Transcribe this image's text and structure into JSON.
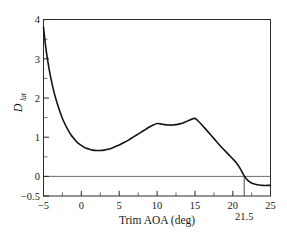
{
  "chart_data": {
    "type": "line",
    "title": "",
    "xlabel": "Trim AOA (deg)",
    "ylabel": "D_lat",
    "ylabel_main": "D",
    "ylabel_sub": "lat",
    "xlim": [
      -5,
      25
    ],
    "ylim": [
      -0.5,
      4
    ],
    "grid": false,
    "legend": null,
    "xticks": [
      -5,
      0,
      5,
      10,
      15,
      20,
      25
    ],
    "xtick_labels": [
      "−5",
      "0",
      "5",
      "10",
      "15",
      "20",
      "25"
    ],
    "xticks_minor": [
      -2.5,
      2.5,
      7.5,
      12.5,
      17.5,
      22.5
    ],
    "yticks": [
      -0.5,
      0,
      1,
      2,
      3,
      4
    ],
    "ytick_labels": [
      "−0.5",
      "0",
      "1",
      "2",
      "3",
      "4"
    ],
    "yticks_minor": [
      0.5,
      1.5,
      2.5,
      3.5
    ],
    "series": [
      {
        "name": "D_lat",
        "color": "#141414",
        "x": [
          -5.0,
          -4.8,
          -4.6,
          -4.4,
          -4.2,
          -4.0,
          -3.7,
          -3.4,
          -3.0,
          -2.6,
          -2.2,
          -1.8,
          -1.4,
          -1.0,
          -0.5,
          0.0,
          0.5,
          1.0,
          1.5,
          2.0,
          2.5,
          3.0,
          3.5,
          4.0,
          4.5,
          5.0,
          5.5,
          6.0,
          6.5,
          7.0,
          7.5,
          8.0,
          8.5,
          9.0,
          9.5,
          10.0,
          10.5,
          11.0,
          11.5,
          12.0,
          12.5,
          13.0,
          13.5,
          14.0,
          14.5,
          15.0,
          15.5,
          16.0,
          16.5,
          17.0,
          17.5,
          18.0,
          18.5,
          19.0,
          19.5,
          20.0,
          20.5,
          21.0,
          21.5,
          22.0,
          22.5,
          23.0,
          23.5,
          24.0,
          24.5,
          25.0
        ],
        "y": [
          3.8,
          3.45,
          3.15,
          2.9,
          2.68,
          2.48,
          2.22,
          2.0,
          1.75,
          1.53,
          1.35,
          1.2,
          1.07,
          0.97,
          0.86,
          0.79,
          0.73,
          0.7,
          0.67,
          0.66,
          0.66,
          0.67,
          0.69,
          0.72,
          0.76,
          0.8,
          0.85,
          0.9,
          0.96,
          1.02,
          1.08,
          1.14,
          1.2,
          1.26,
          1.31,
          1.35,
          1.34,
          1.32,
          1.31,
          1.31,
          1.32,
          1.34,
          1.37,
          1.41,
          1.45,
          1.48,
          1.4,
          1.3,
          1.19,
          1.08,
          0.97,
          0.86,
          0.75,
          0.65,
          0.55,
          0.45,
          0.34,
          0.2,
          0.02,
          -0.1,
          -0.17,
          -0.2,
          -0.22,
          -0.23,
          -0.23,
          -0.23
        ]
      }
    ],
    "annotations": [
      {
        "name": "crossing-21p5",
        "label": "21.5",
        "x": 21.5,
        "type": "vertical-line",
        "y_from": 0,
        "y_to": -0.5
      },
      {
        "name": "zero-reference",
        "label": "",
        "y": 0,
        "type": "horizontal-line"
      }
    ]
  }
}
